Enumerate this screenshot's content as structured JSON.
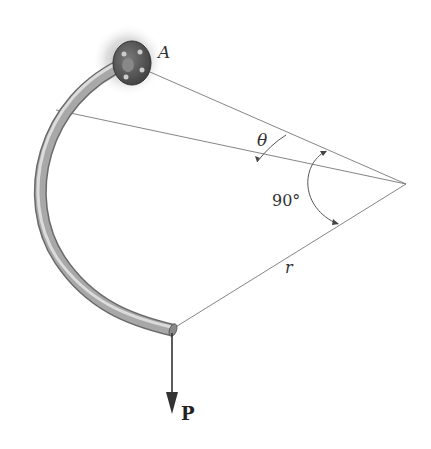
{
  "figure": {
    "labels": {
      "support": "A",
      "angle_variable": "θ",
      "arc_angle": "90°",
      "radius": "r",
      "force": "P"
    },
    "geometry": {
      "center": [
        406,
        184
      ],
      "support_point": [
        140,
        65
      ],
      "section_point": [
        58,
        110
      ],
      "free_end": [
        172,
        330
      ],
      "load_end": [
        172,
        397
      ]
    },
    "colors": {
      "rod": "#9a9a9a",
      "rod_highlight": "#d8d8d8",
      "flange": "#5a5a5a",
      "lines": "#666666",
      "arrow": "#333333"
    }
  }
}
